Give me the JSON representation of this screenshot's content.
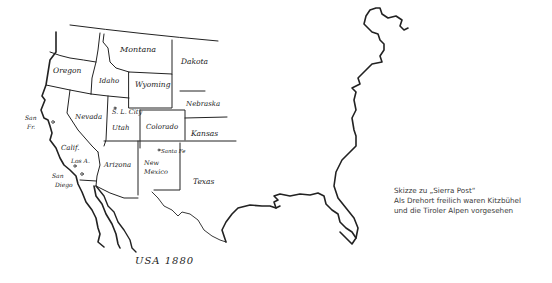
{
  "map": {
    "title": "USA 1880",
    "states": [
      {
        "name": "Montana",
        "x": 120,
        "y": 52,
        "size": 8
      },
      {
        "name": "Dakota",
        "x": 181,
        "y": 64,
        "size": 7.5
      },
      {
        "name": "Oregon",
        "x": 53,
        "y": 73,
        "size": 7.5
      },
      {
        "name": "Idaho",
        "x": 99,
        "y": 83,
        "size": 7
      },
      {
        "name": "Wyoming",
        "x": 135,
        "y": 87,
        "size": 7.5
      },
      {
        "name": "Nebraska",
        "x": 186,
        "y": 106,
        "size": 7
      },
      {
        "name": "Nevada",
        "x": 75,
        "y": 119,
        "size": 7
      },
      {
        "name": "S. L. City",
        "x": 112,
        "y": 114,
        "size": 6.5
      },
      {
        "name": "Utah",
        "x": 112,
        "y": 130,
        "size": 7
      },
      {
        "name": "Colorado",
        "x": 146,
        "y": 129,
        "size": 7
      },
      {
        "name": "Kansas",
        "x": 191,
        "y": 136,
        "size": 7.5
      },
      {
        "name": "Calif.",
        "x": 61,
        "y": 150,
        "size": 7
      },
      {
        "name": "Los A.",
        "x": 71,
        "y": 163,
        "size": 6
      },
      {
        "name": "Arizona",
        "x": 104,
        "y": 167,
        "size": 7
      },
      {
        "name": "Santa Fe",
        "x": 159,
        "y": 154,
        "size": 5.5
      },
      {
        "name": "New",
        "x": 144,
        "y": 165,
        "size": 6.5
      },
      {
        "name": "Mexico",
        "x": 144,
        "y": 174,
        "size": 6.5
      },
      {
        "name": "Texas",
        "x": 193,
        "y": 184,
        "size": 7.5
      },
      {
        "name": "San",
        "x": 52,
        "y": 178,
        "size": 6
      },
      {
        "name": "Diego",
        "x": 55,
        "y": 187,
        "size": 6
      },
      {
        "name": "San",
        "x": 25,
        "y": 120,
        "size": 6
      },
      {
        "name": "Fr.",
        "x": 27,
        "y": 129,
        "size": 6
      }
    ]
  },
  "caption": {
    "lines": [
      "Skizze zu „Sierra Post“",
      "Als Drehort freilich waren Kitzbühel",
      "und die Tiroler Alpen vorgesehen"
    ]
  },
  "colors": {
    "ink": "#222222",
    "caption_text": "#3a3a3a",
    "background": "#ffffff"
  }
}
